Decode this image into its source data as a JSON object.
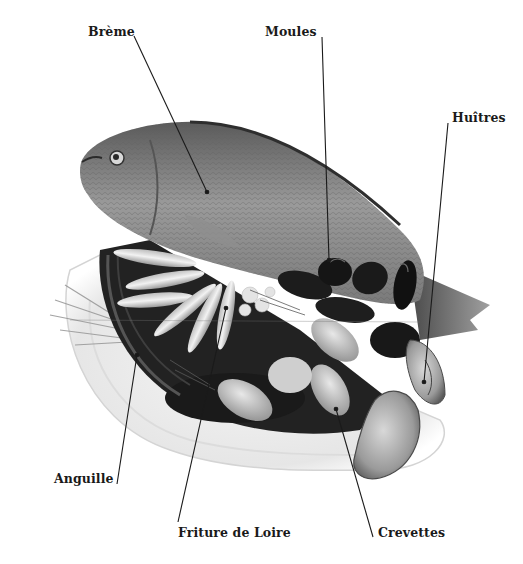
{
  "figure": {
    "labels": [
      {
        "id": "breme",
        "text": "Brème",
        "x": 88,
        "y": 25,
        "line": {
          "x1": 134,
          "y1": 36,
          "x2": 207,
          "y2": 192
        }
      },
      {
        "id": "moules",
        "text": "Moules",
        "x": 265,
        "y": 25,
        "line": {
          "x1": 322,
          "y1": 37,
          "x2": 329,
          "y2": 260
        }
      },
      {
        "id": "huitres",
        "text": "Huîtres",
        "x": 452,
        "y": 111,
        "line": {
          "x1": 448,
          "y1": 123,
          "x2": 424,
          "y2": 382
        }
      },
      {
        "id": "anguille",
        "text": "Anguille",
        "x": 54,
        "y": 472,
        "line": {
          "x1": 117,
          "y1": 484,
          "x2": 137,
          "y2": 355
        }
      },
      {
        "id": "friture",
        "text": "Friture de Loire",
        "x": 178,
        "y": 526,
        "line": {
          "x1": 178,
          "y1": 522,
          "x2": 226,
          "y2": 308
        }
      },
      {
        "id": "crevettes",
        "text": "Crevettes",
        "x": 378,
        "y": 526,
        "line": {
          "x1": 373,
          "y1": 537,
          "x2": 336,
          "y2": 409
        }
      }
    ],
    "colors": {
      "background": "#ffffff",
      "label_text": "#1a1a1a",
      "leader_line": "#1a1a1a",
      "plate": "#f0f0f0",
      "fish_body": "#8a8a8a",
      "mussels": "#1c1c1c",
      "shrimp": "#c8c8c8"
    }
  }
}
